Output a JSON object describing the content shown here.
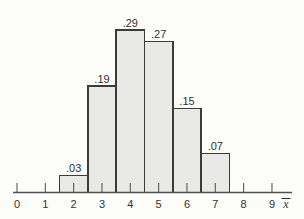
{
  "chart_data": {
    "type": "bar",
    "subtype": "probability-histogram",
    "title": "",
    "categories": [
      2,
      3,
      4,
      5,
      6,
      7
    ],
    "values": [
      0.03,
      0.19,
      0.29,
      0.27,
      0.15,
      0.07
    ],
    "bar_labels": [
      ".03",
      ".19",
      ".29",
      ".27",
      ".15",
      ".07"
    ],
    "bar_width": 1,
    "x_ticks": [
      "0",
      "1",
      "2",
      "3",
      "4",
      "5",
      "6",
      "7",
      "8",
      "9"
    ],
    "xlabel": "x̄",
    "ylabel": "",
    "x_range": [
      0,
      9.8
    ],
    "y_range": [
      0,
      0.3
    ],
    "grid": false,
    "legend": false,
    "colors": {
      "background": "#fcfcf9",
      "bar_fill": "#e9e9e5",
      "bar_border": "#3b3b3b",
      "axis": "#4f4f4f",
      "tick": "#5a5a5a",
      "text": "#333333"
    }
  }
}
